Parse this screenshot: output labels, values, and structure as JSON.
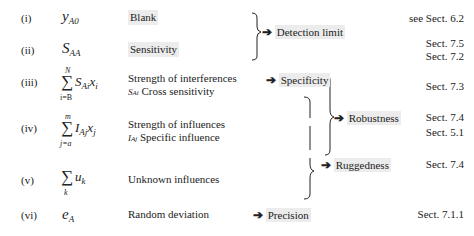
{
  "rows": [
    {
      "index": "(i)",
      "term": "y",
      "term_sub": "A0",
      "description": [
        "Blank"
      ],
      "highlight": true
    },
    {
      "index": "(ii)",
      "term": "S",
      "term_sub": "AA",
      "description": [
        "Sensitivity"
      ],
      "highlight": true
    },
    {
      "index": "(iii)",
      "sum_upper": "N",
      "sum_lower": "i=B",
      "term": "S",
      "term_sub": "Ai",
      "term_tail": "x",
      "tail_sub": "i",
      "description": [
        "Strength of interferences",
        "S",
        "Ai",
        " Cross sensitivity"
      ]
    },
    {
      "index": "(iv)",
      "sum_upper": "m",
      "sum_lower": "j=a",
      "term": "I",
      "term_sub": "Aj",
      "term_tail": "x",
      "tail_sub": "j",
      "description": [
        "Strength of influences",
        "I",
        "Aj",
        " Specific influence"
      ]
    },
    {
      "index": "(v)",
      "sum_lower": "k",
      "term": "u",
      "term_sub": "k",
      "description": [
        "Unknown influences"
      ]
    },
    {
      "index": "(vi)",
      "term": "e",
      "term_sub": "A",
      "description": [
        "Random deviation"
      ]
    }
  ],
  "results": {
    "detection_limit": "Detection limit",
    "specificity": "Specificity",
    "robustness": "Robustness",
    "ruggedness": "Ruggedness",
    "precision": "Precision"
  },
  "arrow": "➔",
  "sum_symbol": "∑",
  "sections": [
    {
      "text": "see Sect. 6.2"
    },
    {
      "text": "Sect. 7.5"
    },
    {
      "text": "Sect. 7.2"
    },
    {
      "text": "Sect. 7.3"
    },
    {
      "text": "Sect. 7.4"
    },
    {
      "text": "Sect. 5.1"
    },
    {
      "text": "Sect. 7.4"
    },
    {
      "text": "Sect. 7.1.1"
    }
  ],
  "colors": {
    "highlight": "#ececec",
    "ink": "#222222"
  }
}
